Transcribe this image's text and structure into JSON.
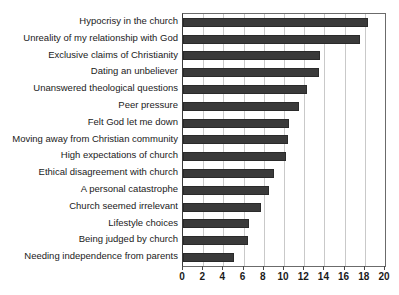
{
  "chart_data": {
    "type": "bar",
    "orientation": "horizontal",
    "title": "",
    "xlabel": "",
    "ylabel": "",
    "xlim": [
      0,
      20
    ],
    "xticks": [
      0,
      2,
      4,
      6,
      8,
      10,
      12,
      14,
      16,
      18,
      20
    ],
    "grid": true,
    "legend": false,
    "bar_color": "#3a3a3a",
    "categories": [
      "Hypocrisy in the church",
      "Unreality of my relationship with God",
      "Exclusive claims of Christianity",
      "Dating an unbeliever",
      "Unanswered theological questions",
      "Peer pressure",
      "Felt God let me down",
      "Moving away from Christian community",
      "High expectations of church",
      "Ethical disagreement with church",
      "A personal catastrophe",
      "Church seemed irrelevant",
      "Lifestyle choices",
      "Being judged by church",
      "Needing independence from parents"
    ],
    "values": [
      18.3,
      17.5,
      13.6,
      13.5,
      12.3,
      11.5,
      10.5,
      10.4,
      10.2,
      9.0,
      8.5,
      7.7,
      6.5,
      6.4,
      5.0
    ]
  }
}
